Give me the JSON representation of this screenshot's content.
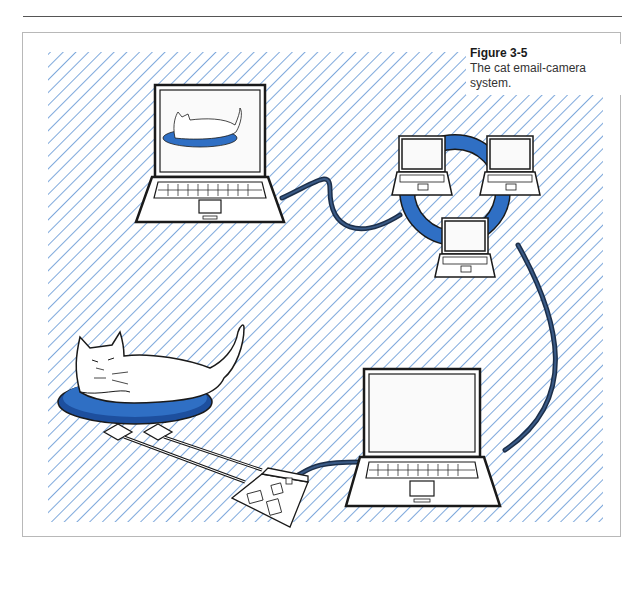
{
  "figure": {
    "label": "Figure 3-5",
    "caption": "The cat email-camera system."
  },
  "colors": {
    "hatch": "#7fa9dc",
    "accent_blue": "#2f6fc4",
    "cable": "#1c2f4a",
    "outline": "#1a1a1a",
    "frame_border": "#b8b8b8"
  },
  "diagram": {
    "nodes": [
      {
        "id": "viewer-laptop",
        "label": "laptop showing cat photo"
      },
      {
        "id": "internet-ring",
        "label": "network of three laptops on a ring"
      },
      {
        "id": "home-laptop",
        "label": "laptop"
      },
      {
        "id": "microcontroller-board",
        "label": "board with sensor pads"
      },
      {
        "id": "cat-on-bed",
        "label": "cat lying on blue bed"
      }
    ],
    "edges": [
      {
        "from": "viewer-laptop",
        "to": "internet-ring"
      },
      {
        "from": "internet-ring",
        "to": "home-laptop"
      },
      {
        "from": "home-laptop",
        "to": "microcontroller-board"
      },
      {
        "from": "microcontroller-board",
        "to": "cat-on-bed"
      }
    ]
  }
}
